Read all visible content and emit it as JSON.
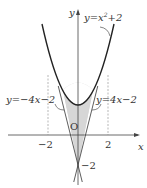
{
  "figure": {
    "axis_x_label": "x",
    "axis_y_label": "y",
    "origin_label": "O",
    "tick_neg2": "−2",
    "tick_pos2": "2",
    "y_intercept_label": "−2",
    "curve_label": "y = x² + 2",
    "curve_label_parts": {
      "lhs": "y=x",
      "exp": "2",
      "rhs": "+2"
    },
    "left_line_label": "y=−4x−2",
    "right_line_label": "y=4x−2",
    "shade_color": "#d9d9d9",
    "curve_color": "#222222"
  }
}
